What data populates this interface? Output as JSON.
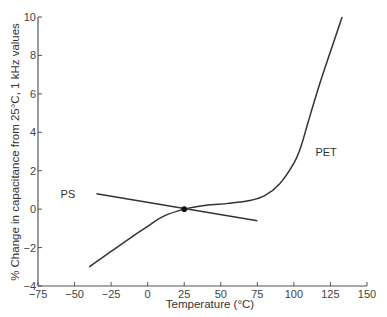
{
  "chart_data": {
    "type": "line",
    "title": "",
    "xlabel": "Temperature (°C)",
    "ylabel": "% Change in capacitance from 25°C, 1 kHz values",
    "xlim": [
      -75,
      150
    ],
    "ylim": [
      -4,
      10
    ],
    "xticks": [
      -75,
      -50,
      -25,
      0,
      25,
      50,
      75,
      100,
      125,
      150
    ],
    "yticks": [
      -4,
      -2,
      0,
      2,
      4,
      6,
      8,
      10
    ],
    "grid": false,
    "legend": "inline labels",
    "series": [
      {
        "name": "PS",
        "label_position": [
          -50,
          0.8
        ],
        "x": [
          -35,
          0,
          25,
          50,
          75
        ],
        "y": [
          0.8,
          0.35,
          0.0,
          -0.3,
          -0.6
        ]
      },
      {
        "name": "PET",
        "label_position": [
          112,
          3.0
        ],
        "x": [
          -40,
          -25,
          -10,
          0,
          10,
          25,
          40,
          55,
          70,
          80,
          90,
          100,
          105,
          110,
          118,
          125,
          133
        ],
        "y": [
          -3.0,
          -2.2,
          -1.4,
          -0.9,
          -0.4,
          0.0,
          0.2,
          0.3,
          0.45,
          0.7,
          1.3,
          2.4,
          3.3,
          4.6,
          6.6,
          8.2,
          10.0
        ]
      }
    ],
    "annotations": [
      {
        "type": "point",
        "x": 25,
        "y": 0,
        "description": "intersection reference point at 25°C"
      }
    ]
  },
  "labels": {
    "x_axis_title": "Temperature (°C)",
    "y_axis_title": "% Change in capacitance from 25°C, 1 kHz values"
  }
}
